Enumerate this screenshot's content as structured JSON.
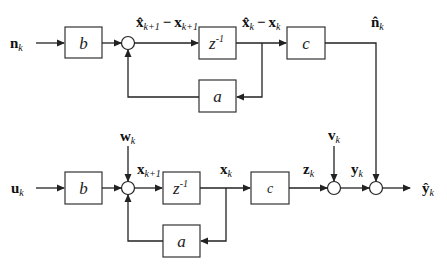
{
  "diagram": {
    "type": "block-diagram",
    "blocks": {
      "top_b": "b",
      "top_delay": "z",
      "top_delay_exp": "-1",
      "top_c": "c",
      "top_a": "a",
      "bot_b": "b",
      "bot_delay": "z",
      "bot_delay_exp": "-1",
      "bot_c": "c",
      "bot_a": "a"
    },
    "signals": {
      "n_k": {
        "base": "n",
        "sub": "k"
      },
      "err_next_hat": {
        "base": "x̂",
        "sub": "k+1"
      },
      "err_next_minus": "−",
      "err_next_x": {
        "base": "x",
        "sub": "k+1"
      },
      "err_hat": {
        "base": "x̂",
        "sub": "k"
      },
      "err_minus": "−",
      "err_x": {
        "base": "x",
        "sub": "k"
      },
      "n_hat": {
        "base": "n̂",
        "sub": "k"
      },
      "w_k": {
        "base": "w",
        "sub": "k"
      },
      "u_k": {
        "base": "u",
        "sub": "k"
      },
      "x_next": {
        "base": "x",
        "sub": "k+1"
      },
      "x_k": {
        "base": "x",
        "sub": "k"
      },
      "z_k": {
        "base": "z",
        "sub": "k"
      },
      "v_k": {
        "base": "v",
        "sub": "k"
      },
      "y_k": {
        "base": "y",
        "sub": "k"
      },
      "y_hat": {
        "base": "ŷ",
        "sub": "k"
      }
    },
    "colors": {
      "line": "#222222",
      "block_border": "#333333",
      "background": "#ffffff"
    }
  }
}
